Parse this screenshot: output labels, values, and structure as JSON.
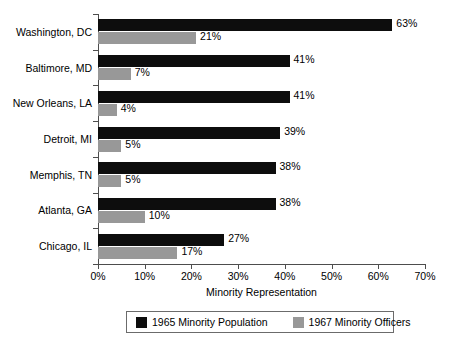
{
  "chart_data": {
    "type": "bar",
    "orientation": "horizontal",
    "title": "",
    "subtitle": "",
    "xlabel": "Minority Representation",
    "ylabel": "",
    "xlim": [
      0,
      70
    ],
    "xtick_labels": [
      "0%",
      "10%",
      "20%",
      "30%",
      "40%",
      "50%",
      "60%",
      "70%"
    ],
    "xtick_values": [
      0,
      10,
      20,
      30,
      40,
      50,
      60,
      70
    ],
    "grid": false,
    "legend_position": "bottom",
    "categories": [
      "Washington, DC",
      "Baltimore, MD",
      "New Orleans, LA",
      "Detroit, MI",
      "Memphis, TN",
      "Atlanta, GA",
      "Chicago, IL"
    ],
    "series": [
      {
        "name": "1965 Minority Population",
        "color": "#0d0d0d",
        "values": [
          63,
          41,
          41,
          39,
          38,
          38,
          27
        ],
        "data_labels": [
          "63%",
          "41%",
          "41%",
          "39%",
          "38%",
          "38%",
          "27%"
        ]
      },
      {
        "name": "1967 Minority Officers",
        "color": "#989898",
        "values": [
          21,
          7,
          4,
          5,
          5,
          10,
          17
        ],
        "data_labels": [
          "21%",
          "7%",
          "4%",
          "5%",
          "5%",
          "10%",
          "17%"
        ]
      }
    ]
  },
  "legend": {
    "entries": [
      {
        "label": "1965 Minority Population",
        "color": "#0d0d0d"
      },
      {
        "label": "1967 Minority Officers",
        "color": "#989898"
      }
    ]
  },
  "axis": {
    "x_title": "Minority Representation"
  },
  "colors": {
    "population_bar": "#0d0d0d",
    "officers_bar": "#989898",
    "axis_line": "#4d4d4d",
    "background": "#ffffff",
    "text": "#000000"
  }
}
